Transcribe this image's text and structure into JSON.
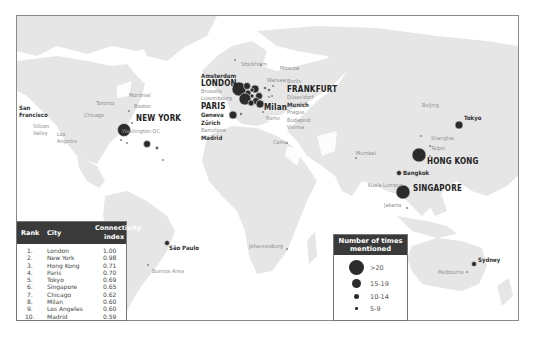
{
  "map": {
    "land_color": "#e6e6e6",
    "marker_color": "#2b2b2b",
    "cities": [
      {
        "name": "San Francisco",
        "lines": [
          "San",
          "Francisco"
        ],
        "size_class": "15-19",
        "style": "medium"
      },
      {
        "name": "Silicon Valley",
        "lines": [
          "Silicon",
          "Valley"
        ],
        "size_class": "5-9",
        "style": "small"
      },
      {
        "name": "Los Angeles",
        "lines": [
          "Los",
          "Angeles"
        ],
        "size_class": "5-9",
        "style": "small"
      },
      {
        "name": "Toronto",
        "size_class": "5-9",
        "style": "small"
      },
      {
        "name": "Montreal",
        "size_class": "5-9",
        "style": "small"
      },
      {
        "name": "Boston",
        "size_class": "5-9",
        "style": "small"
      },
      {
        "name": "Chicago",
        "size_class": "5-9",
        "style": "small"
      },
      {
        "name": "NEW YORK",
        "size_class": ">20",
        "style": "big"
      },
      {
        "name": "Washington DC",
        "size_class": "5-9",
        "style": "small"
      },
      {
        "name": "Stockholm",
        "size_class": "5-9",
        "style": "small"
      },
      {
        "name": "Moscow",
        "size_class": "5-9",
        "style": "small"
      },
      {
        "name": "Amsterdam",
        "size_class": ">20",
        "style": "medium"
      },
      {
        "name": "LONDON",
        "size_class": ">20",
        "style": "big"
      },
      {
        "name": "Brussels",
        "size_class": "15-19",
        "style": "small"
      },
      {
        "name": "Luxembourg",
        "size_class": "10-14",
        "style": "small"
      },
      {
        "name": "PARIS",
        "size_class": ">20",
        "style": "big"
      },
      {
        "name": "Geneva",
        "size_class": "15-19",
        "style": "medium"
      },
      {
        "name": "Zürich",
        "size_class": "15-19",
        "style": "medium"
      },
      {
        "name": "Barcelona",
        "size_class": "10-14",
        "style": "small"
      },
      {
        "name": "Madrid",
        "size_class": ">20",
        "style": "medium"
      },
      {
        "name": "Warsaw",
        "size_class": "5-9",
        "style": "small"
      },
      {
        "name": "Berlin",
        "size_class": "5-9",
        "style": "small"
      },
      {
        "name": "FRANKFURT",
        "size_class": ">20",
        "style": "big"
      },
      {
        "name": "Düsseldorf",
        "size_class": "10-14",
        "style": "small"
      },
      {
        "name": "Munich",
        "size_class": "15-19",
        "style": "medium"
      },
      {
        "name": "Milan",
        "size_class": ">20",
        "style": "big"
      },
      {
        "name": "Rome",
        "size_class": "5-9",
        "style": "small"
      },
      {
        "name": "Prague",
        "size_class": "10-14",
        "style": "small"
      },
      {
        "name": "Budapest",
        "size_class": "5-9",
        "style": "small"
      },
      {
        "name": "Vienna",
        "size_class": "5-9",
        "style": "small"
      },
      {
        "name": "Cairo",
        "size_class": "5-9",
        "style": "small"
      },
      {
        "name": "Mumbai",
        "size_class": "5-9",
        "style": "small"
      },
      {
        "name": "Beijing",
        "size_class": "5-9",
        "style": "small"
      },
      {
        "name": "Tokyo",
        "size_class": "15-19",
        "style": "medium"
      },
      {
        "name": "Shanghai",
        "size_class": "5-9",
        "style": "small"
      },
      {
        "name": "Taipei",
        "size_class": "5-9",
        "style": "small"
      },
      {
        "name": "HONG KONG",
        "size_class": ">20",
        "style": "big"
      },
      {
        "name": "Bangkok",
        "size_class": "10-14",
        "style": "medium"
      },
      {
        "name": "Kuala Lumpur",
        "size_class": "5-9",
        "style": "small"
      },
      {
        "name": "SINGAPORE",
        "size_class": ">20",
        "style": "big"
      },
      {
        "name": "Jakarta",
        "size_class": "5-9",
        "style": "small"
      },
      {
        "name": "São Paulo",
        "size_class": "10-14",
        "style": "medium"
      },
      {
        "name": "Buenos Aires",
        "size_class": "5-9",
        "style": "small"
      },
      {
        "name": "Johannesburg",
        "size_class": "5-9",
        "style": "small"
      },
      {
        "name": "Sydney",
        "size_class": "10-14",
        "style": "medium"
      },
      {
        "name": "Melbourne",
        "size_class": "5-9",
        "style": "small"
      }
    ]
  },
  "ranking_table": {
    "headers": {
      "rank": "Rank",
      "city": "City",
      "index_line1": "Connectivity",
      "index_line2": "index"
    },
    "rows": [
      {
        "rank": "1.",
        "city": "London",
        "index": "1.00"
      },
      {
        "rank": "2.",
        "city": "New York",
        "index": "0.98"
      },
      {
        "rank": "3.",
        "city": "Hong Kong",
        "index": "0.71"
      },
      {
        "rank": "4.",
        "city": "Paris",
        "index": "0.70"
      },
      {
        "rank": "5.",
        "city": "Tokyo",
        "index": "0.69"
      },
      {
        "rank": "6.",
        "city": "Singapore",
        "index": "0.65"
      },
      {
        "rank": "7.",
        "city": "Chicago",
        "index": "0.62"
      },
      {
        "rank": "8.",
        "city": "Milan",
        "index": "0.60"
      },
      {
        "rank": "9.",
        "city": "Los Angeles",
        "index": "0.60"
      },
      {
        "rank": "10.",
        "city": "Madrid",
        "index": "0.59"
      }
    ]
  },
  "legend": {
    "title_line1": "Number of times",
    "title_line2": "mentioned",
    "items": [
      {
        "label": ">20"
      },
      {
        "label": "15-19"
      },
      {
        "label": "10-14"
      },
      {
        "label": "5-9"
      }
    ]
  }
}
